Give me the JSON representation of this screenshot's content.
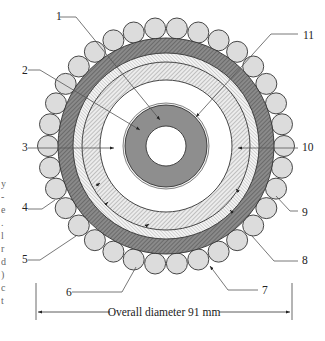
{
  "figure": {
    "type": "cable cross-section",
    "dimension_label": "Overall diameter 91 mm",
    "center": [
      166,
      146
    ],
    "layers": [
      {
        "id": "bore",
        "r_outer": 20,
        "fill": "#ffffff"
      },
      {
        "id": "conductor",
        "r_inner": 20,
        "r_outer": 41,
        "fill": "#8c8c8c"
      },
      {
        "id": "conductor-screen",
        "r_inner": 41,
        "r_outer": 43,
        "fill": "#ffffff"
      },
      {
        "id": "insulation",
        "r_inner": 43,
        "r_outer": 66,
        "fill": "#ffffff"
      },
      {
        "id": "screen-hatch",
        "r_inner": 66,
        "r_outer": 84,
        "fill": "#e6e6e6"
      },
      {
        "id": "thin-hatch",
        "r_inner": 84,
        "r_outer": 93,
        "fill": "#f0f0f0"
      },
      {
        "id": "sheath",
        "r_inner": 93,
        "r_outer": 108,
        "fill": "#777777"
      },
      {
        "id": "armour-wires",
        "ring_radius": 118,
        "wire_radius": 10.5,
        "count": 34,
        "fill": "#dcdcdc"
      }
    ],
    "callouts": [
      {
        "label": "1",
        "text_x": 56,
        "text_y": 20
      },
      {
        "label": "2",
        "text_x": 22,
        "text_y": 74
      },
      {
        "label": "3",
        "text_x": 22,
        "text_y": 151
      },
      {
        "label": "4",
        "text_x": 22,
        "text_y": 211
      },
      {
        "label": "5",
        "text_x": 22,
        "text_y": 263
      },
      {
        "label": "6",
        "text_x": 66,
        "text_y": 296
      },
      {
        "label": "7",
        "text_x": 262,
        "text_y": 294
      },
      {
        "label": "8",
        "text_x": 302,
        "text_y": 264
      },
      {
        "label": "9",
        "text_x": 302,
        "text_y": 216
      },
      {
        "label": "10",
        "text_x": 302,
        "text_y": 151
      },
      {
        "label": "11",
        "text_x": 303,
        "text_y": 39
      }
    ],
    "edge_fragments": [
      "y",
      "-",
      "e",
      ".",
      "l",
      "r",
      "d",
      ")",
      "c",
      "t"
    ]
  }
}
